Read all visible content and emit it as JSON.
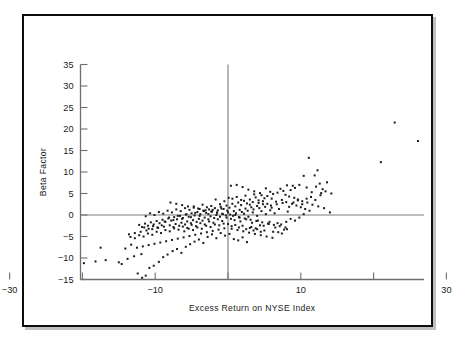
{
  "chart_data": {
    "type": "scatter",
    "title": "",
    "xlabel": "Excess Return on NYSE Index",
    "ylabel": "Beta Factor",
    "xlim": [
      -30,
      37
    ],
    "ylim": [
      -15,
      35
    ],
    "grid": false,
    "legend": null,
    "reference_lines": [
      {
        "axis": "x",
        "value": 0
      },
      {
        "axis": "y",
        "value": 0
      }
    ],
    "xticks": [
      -30,
      -20,
      -10,
      0,
      10,
      20,
      30
    ],
    "xticklabels": [
      "−30",
      "",
      "−10",
      "",
      "10",
      "",
      "30"
    ],
    "yticks": [
      -15,
      -10,
      -5,
      0,
      5,
      10,
      15,
      20,
      25,
      30,
      35
    ],
    "yticklabels": [
      "−15",
      "−10",
      "−5",
      "0",
      "5",
      "10",
      "15",
      "20",
      "25",
      "30",
      "35"
    ],
    "marker": "square",
    "marker_color": "#1c1c1c",
    "marker_size": 2.0,
    "n_points": 352,
    "points": [
      [
        31.2,
        33.0
      ],
      [
        22.9,
        21.5
      ],
      [
        26.1,
        17.2
      ],
      [
        21.0,
        12.3
      ],
      [
        11.1,
        13.3
      ],
      [
        12.3,
        10.4
      ],
      [
        11.9,
        9.2
      ],
      [
        10.4,
        9.1
      ],
      [
        13.6,
        7.6
      ],
      [
        12.6,
        7.3
      ],
      [
        12.1,
        6.6
      ],
      [
        13.0,
        6.0
      ],
      [
        12.8,
        5.1
      ],
      [
        11.5,
        5.3
      ],
      [
        10.8,
        6.4
      ],
      [
        9.8,
        7.0
      ],
      [
        9.2,
        6.3
      ],
      [
        8.6,
        5.8
      ],
      [
        8.9,
        6.8
      ],
      [
        8.1,
        6.9
      ],
      [
        7.6,
        5.6
      ],
      [
        7.2,
        6.1
      ],
      [
        6.8,
        5.2
      ],
      [
        7.9,
        4.7
      ],
      [
        8.4,
        4.3
      ],
      [
        9.1,
        4.0
      ],
      [
        9.6,
        3.6
      ],
      [
        10.2,
        3.2
      ],
      [
        10.9,
        2.9
      ],
      [
        11.6,
        2.4
      ],
      [
        12.4,
        2.0
      ],
      [
        13.2,
        1.6
      ],
      [
        14.0,
        0.6
      ],
      [
        6.2,
        4.9
      ],
      [
        5.8,
        5.4
      ],
      [
        5.4,
        4.4
      ],
      [
        5.0,
        3.9
      ],
      [
        4.6,
        4.6
      ],
      [
        4.2,
        3.4
      ],
      [
        3.8,
        4.1
      ],
      [
        3.4,
        3.0
      ],
      [
        3.0,
        3.6
      ],
      [
        2.6,
        2.7
      ],
      [
        2.2,
        3.3
      ],
      [
        1.8,
        2.3
      ],
      [
        1.4,
        2.9
      ],
      [
        1.0,
        2.0
      ],
      [
        0.6,
        2.6
      ],
      [
        0.2,
        1.7
      ],
      [
        -0.2,
        2.2
      ],
      [
        -0.6,
        1.4
      ],
      [
        -1.0,
        1.9
      ],
      [
        -1.4,
        1.1
      ],
      [
        -1.8,
        1.6
      ],
      [
        -2.2,
        0.8
      ],
      [
        -2.6,
        1.3
      ],
      [
        -3.0,
        0.5
      ],
      [
        -3.4,
        1.0
      ],
      [
        -3.8,
        0.2
      ],
      [
        -4.2,
        0.7
      ],
      [
        -4.6,
        -0.1
      ],
      [
        -5.0,
        0.4
      ],
      [
        -5.4,
        -0.4
      ],
      [
        -5.8,
        0.1
      ],
      [
        -6.2,
        -0.7
      ],
      [
        -6.6,
        -0.2
      ],
      [
        -7.0,
        -1.0
      ],
      [
        -7.4,
        -0.5
      ],
      [
        -7.8,
        -1.3
      ],
      [
        -8.2,
        -0.8
      ],
      [
        -8.6,
        -1.6
      ],
      [
        -9.0,
        -1.1
      ],
      [
        -9.4,
        -1.9
      ],
      [
        -9.8,
        -1.4
      ],
      [
        -10.2,
        -2.2
      ],
      [
        -10.6,
        -1.7
      ],
      [
        -11.0,
        -2.5
      ],
      [
        -11.4,
        -2.0
      ],
      [
        -11.8,
        -2.8
      ],
      [
        -12.2,
        -2.3
      ],
      [
        0.4,
        6.8
      ],
      [
        1.2,
        7.0
      ],
      [
        2.0,
        6.5
      ],
      [
        2.8,
        5.9
      ],
      [
        3.6,
        5.5
      ],
      [
        4.4,
        5.1
      ],
      [
        5.2,
        6.2
      ],
      [
        6.0,
        3.8
      ],
      [
        6.6,
        3.1
      ],
      [
        7.4,
        3.5
      ],
      [
        8.0,
        3.0
      ],
      [
        8.8,
        2.6
      ],
      [
        9.4,
        2.2
      ],
      [
        10.0,
        1.8
      ],
      [
        10.6,
        1.4
      ],
      [
        11.2,
        1.0
      ],
      [
        4.8,
        2.5
      ],
      [
        4.0,
        2.1
      ],
      [
        3.2,
        1.8
      ],
      [
        2.4,
        1.5
      ],
      [
        1.6,
        1.2
      ],
      [
        0.8,
        0.9
      ],
      [
        0.0,
        0.6
      ],
      [
        -0.8,
        0.3
      ],
      [
        -1.6,
        0.0
      ],
      [
        -2.4,
        -0.3
      ],
      [
        -3.2,
        -0.6
      ],
      [
        -4.0,
        -0.9
      ],
      [
        -4.8,
        -1.2
      ],
      [
        -5.6,
        -1.5
      ],
      [
        -6.4,
        -1.8
      ],
      [
        -7.2,
        -2.1
      ],
      [
        -8.0,
        -2.4
      ],
      [
        -8.8,
        -2.7
      ],
      [
        -9.6,
        -3.0
      ],
      [
        -10.4,
        -3.3
      ],
      [
        -11.2,
        -3.6
      ],
      [
        -12.0,
        -3.9
      ],
      [
        -12.8,
        -4.2
      ],
      [
        -13.6,
        -4.5
      ],
      [
        0.3,
        0.1
      ],
      [
        0.7,
        -0.2
      ],
      [
        1.1,
        0.4
      ],
      [
        1.5,
        -0.5
      ],
      [
        1.9,
        0.7
      ],
      [
        2.3,
        -0.8
      ],
      [
        2.7,
        1.0
      ],
      [
        3.1,
        -1.1
      ],
      [
        3.5,
        1.3
      ],
      [
        3.9,
        -1.4
      ],
      [
        4.3,
        1.6
      ],
      [
        4.7,
        -1.7
      ],
      [
        5.1,
        1.9
      ],
      [
        5.5,
        -2.0
      ],
      [
        5.9,
        2.2
      ],
      [
        6.3,
        -2.3
      ],
      [
        6.7,
        2.5
      ],
      [
        7.1,
        -2.6
      ],
      [
        7.5,
        2.8
      ],
      [
        7.9,
        -2.9
      ],
      [
        -0.3,
        -0.1
      ],
      [
        -0.7,
        0.2
      ],
      [
        -1.1,
        -0.4
      ],
      [
        -1.5,
        0.5
      ],
      [
        -1.9,
        -0.7
      ],
      [
        -2.3,
        0.8
      ],
      [
        -2.7,
        -1.0
      ],
      [
        -3.1,
        1.1
      ],
      [
        -3.5,
        -1.3
      ],
      [
        -3.9,
        1.4
      ],
      [
        -4.3,
        -1.6
      ],
      [
        -4.7,
        1.7
      ],
      [
        -5.1,
        -1.9
      ],
      [
        -5.5,
        2.0
      ],
      [
        -5.9,
        -2.2
      ],
      [
        -6.3,
        2.3
      ],
      [
        -6.7,
        -2.5
      ],
      [
        -7.1,
        2.6
      ],
      [
        -7.5,
        -2.8
      ],
      [
        -7.9,
        2.9
      ],
      [
        0.5,
        -3.2
      ],
      [
        1.3,
        -3.5
      ],
      [
        2.1,
        -3.8
      ],
      [
        2.9,
        -4.1
      ],
      [
        3.7,
        -4.4
      ],
      [
        4.5,
        -4.7
      ],
      [
        5.3,
        -5.0
      ],
      [
        6.1,
        -5.3
      ],
      [
        6.9,
        -4.0
      ],
      [
        7.7,
        -3.4
      ],
      [
        -0.5,
        -3.1
      ],
      [
        -1.3,
        -3.4
      ],
      [
        -2.1,
        -3.7
      ],
      [
        -2.9,
        -4.0
      ],
      [
        -3.7,
        -4.3
      ],
      [
        -4.5,
        -4.6
      ],
      [
        -5.3,
        -4.9
      ],
      [
        -6.1,
        -5.2
      ],
      [
        -6.9,
        -5.5
      ],
      [
        -7.7,
        -5.8
      ],
      [
        -8.5,
        -6.1
      ],
      [
        -9.3,
        -6.4
      ],
      [
        -10.1,
        -6.7
      ],
      [
        -10.9,
        -7.0
      ],
      [
        -11.7,
        -7.3
      ],
      [
        -12.5,
        -7.6
      ],
      [
        -13.3,
        -6.9
      ],
      [
        -14.1,
        -7.8
      ],
      [
        -12.9,
        -9.6
      ],
      [
        -11.9,
        -9.1
      ],
      [
        -13.8,
        -10.2
      ],
      [
        -15.0,
        -11.0
      ],
      [
        -16.8,
        -10.5
      ],
      [
        -19.8,
        -11.2
      ],
      [
        -22.8,
        -10.4
      ],
      [
        -20.6,
        -7.2
      ],
      [
        -21.9,
        -6.1
      ],
      [
        -18.2,
        -10.8
      ],
      [
        -17.5,
        -7.6
      ],
      [
        -14.6,
        -11.4
      ],
      [
        -12.4,
        -13.6
      ],
      [
        -11.8,
        -14.6
      ],
      [
        -11.3,
        -14.1
      ],
      [
        -10.8,
        -12.3
      ],
      [
        -10.2,
        -11.8
      ],
      [
        -9.5,
        -10.9
      ],
      [
        -8.9,
        -9.8
      ],
      [
        -8.3,
        -9.2
      ],
      [
        -7.6,
        -8.4
      ],
      [
        -7.0,
        -7.9
      ],
      [
        -6.4,
        -8.8
      ],
      [
        -5.8,
        -7.4
      ],
      [
        -5.2,
        -6.8
      ],
      [
        -4.6,
        -6.2
      ],
      [
        -4.0,
        -5.7
      ],
      [
        -3.4,
        -6.5
      ],
      [
        -2.8,
        -5.1
      ],
      [
        -2.2,
        -4.5
      ],
      [
        -1.6,
        -5.4
      ],
      [
        -1.0,
        -4.2
      ],
      [
        -0.4,
        -4.8
      ],
      [
        0.2,
        -4.4
      ],
      [
        0.8,
        -5.6
      ],
      [
        1.4,
        -5.9
      ],
      [
        2.0,
        -5.2
      ],
      [
        2.6,
        -6.3
      ],
      [
        3.2,
        -2.8
      ],
      [
        3.8,
        -3.1
      ],
      [
        4.4,
        -2.4
      ],
      [
        5.0,
        -3.6
      ],
      [
        5.6,
        -2.1
      ],
      [
        6.2,
        -3.9
      ],
      [
        6.8,
        -1.9
      ],
      [
        7.4,
        -4.3
      ],
      [
        8.0,
        -1.6
      ],
      [
        8.6,
        -0.9
      ],
      [
        9.2,
        -1.3
      ],
      [
        9.8,
        -0.6
      ],
      [
        10.4,
        0.2
      ],
      [
        8.2,
        0.8
      ],
      [
        7.0,
        1.4
      ],
      [
        6.4,
        0.4
      ],
      [
        5.8,
        1.1
      ],
      [
        5.2,
        0.2
      ],
      [
        4.6,
        0.9
      ],
      [
        4.0,
        -0.2
      ],
      [
        3.4,
        0.6
      ],
      [
        2.8,
        -0.4
      ],
      [
        2.2,
        0.3
      ],
      [
        1.6,
        -0.6
      ],
      [
        1.0,
        0.0
      ],
      [
        0.4,
        -0.9
      ],
      [
        -0.2,
        -0.6
      ],
      [
        -0.8,
        -1.4
      ],
      [
        -1.4,
        -1.0
      ],
      [
        -2.0,
        -1.8
      ],
      [
        -2.6,
        -1.5
      ],
      [
        -3.2,
        -2.2
      ],
      [
        -3.8,
        -1.9
      ],
      [
        -4.4,
        -2.6
      ],
      [
        -5.0,
        -2.3
      ],
      [
        -5.6,
        -3.0
      ],
      [
        -6.2,
        -2.7
      ],
      [
        -6.8,
        -3.4
      ],
      [
        -7.4,
        -3.1
      ],
      [
        -8.0,
        -3.8
      ],
      [
        -8.6,
        -3.5
      ],
      [
        -9.2,
        -4.2
      ],
      [
        -9.8,
        -3.9
      ],
      [
        -10.4,
        -4.6
      ],
      [
        -11.0,
        -4.3
      ],
      [
        -11.6,
        -5.0
      ],
      [
        -12.2,
        -4.7
      ],
      [
        -12.8,
        -5.4
      ],
      [
        -13.4,
        -5.1
      ],
      [
        0.6,
        3.8
      ],
      [
        1.2,
        4.2
      ],
      [
        1.8,
        3.5
      ],
      [
        2.4,
        4.5
      ],
      [
        3.0,
        2.4
      ],
      [
        3.6,
        4.8
      ],
      [
        4.2,
        2.8
      ],
      [
        4.8,
        3.2
      ],
      [
        5.4,
        2.6
      ],
      [
        6.0,
        1.7
      ],
      [
        0.1,
        4.0
      ],
      [
        -0.5,
        3.2
      ],
      [
        -1.1,
        2.5
      ],
      [
        -1.7,
        3.6
      ],
      [
        -2.3,
        2.1
      ],
      [
        -2.9,
        1.8
      ],
      [
        -3.5,
        2.4
      ],
      [
        -4.1,
        1.5
      ],
      [
        -4.7,
        2.0
      ],
      [
        -5.3,
        1.2
      ],
      [
        -5.9,
        1.6
      ],
      [
        -6.5,
        0.9
      ],
      [
        -7.1,
        1.3
      ],
      [
        -7.7,
        0.6
      ],
      [
        -8.3,
        1.0
      ],
      [
        -8.9,
        0.3
      ],
      [
        -9.5,
        0.7
      ],
      [
        -10.1,
        0.0
      ],
      [
        -10.7,
        0.4
      ],
      [
        -11.3,
        -0.3
      ],
      [
        8.4,
        1.9
      ],
      [
        9.0,
        2.9
      ],
      [
        9.6,
        3.4
      ],
      [
        10.2,
        2.5
      ],
      [
        10.8,
        3.8
      ],
      [
        11.4,
        4.2
      ],
      [
        12.0,
        3.5
      ],
      [
        12.7,
        4.6
      ],
      [
        13.4,
        5.5
      ],
      [
        14.2,
        5.0
      ],
      [
        0.9,
        -1.2
      ],
      [
        1.7,
        -1.5
      ],
      [
        2.5,
        -1.0
      ],
      [
        3.3,
        -1.8
      ],
      [
        4.1,
        -1.3
      ],
      [
        4.9,
        -2.5
      ],
      [
        5.7,
        -1.6
      ],
      [
        6.5,
        -2.9
      ],
      [
        7.3,
        -2.2
      ],
      [
        8.1,
        -3.3
      ],
      [
        -0.1,
        1.0
      ],
      [
        -0.9,
        1.5
      ],
      [
        -1.5,
        0.6
      ],
      [
        -2.1,
        1.2
      ],
      [
        -2.7,
        0.2
      ],
      [
        -3.3,
        0.9
      ],
      [
        -3.9,
        -0.2
      ],
      [
        -4.5,
        0.5
      ],
      [
        -5.1,
        -0.5
      ],
      [
        -5.7,
        0.2
      ],
      [
        -6.3,
        -0.9
      ],
      [
        -6.9,
        -0.2
      ],
      [
        -7.5,
        -1.2
      ],
      [
        -8.1,
        -0.6
      ],
      [
        -8.7,
        -1.5
      ],
      [
        -9.1,
        -2.4
      ],
      [
        -9.7,
        -2.9
      ],
      [
        -10.3,
        -2.6
      ],
      [
        -10.9,
        -3.2
      ],
      [
        -11.5,
        -2.9
      ],
      [
        0.0,
        -2.1
      ],
      [
        0.5,
        -2.6
      ],
      [
        1.0,
        -2.3
      ],
      [
        1.5,
        -2.9
      ],
      [
        2.0,
        -2.5
      ],
      [
        2.5,
        -3.3
      ],
      [
        3.0,
        -3.0
      ],
      [
        3.5,
        -3.6
      ],
      [
        4.0,
        -3.3
      ],
      [
        4.5,
        -3.9
      ],
      [
        -0.6,
        -2.0
      ],
      [
        -1.2,
        -2.4
      ],
      [
        -1.8,
        -2.2
      ],
      [
        -2.4,
        -2.8
      ],
      [
        -3.0,
        -2.5
      ],
      [
        -3.6,
        -3.2
      ],
      [
        -4.2,
        -2.9
      ],
      [
        -4.8,
        -3.5
      ],
      [
        -5.4,
        -3.2
      ],
      [
        -6.0,
        -3.8
      ]
    ]
  },
  "axes": {
    "y_title": "Beta Factor",
    "x_title": "Excess Return on NYSE Index"
  }
}
